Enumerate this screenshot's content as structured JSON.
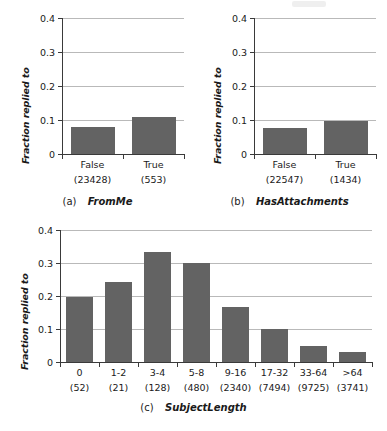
{
  "figure": {
    "background": "#ffffff",
    "bar_color": "#636363",
    "grid_color": "#b9b9b9",
    "axis_color": "#3a3a3a"
  },
  "chart_data": [
    {
      "type": "bar",
      "panel": "a",
      "caption_tag": "(a)",
      "title": "FromMe",
      "xlabel": "",
      "ylabel": "Fraction replied to",
      "categories": [
        "False",
        "True"
      ],
      "counts": [
        "(23428)",
        "(553)"
      ],
      "values": [
        0.078,
        0.108
      ],
      "ylim": [
        0,
        0.4
      ],
      "yticks": [
        0,
        0.1,
        0.2,
        0.3,
        0.4
      ],
      "ytick_labels": [
        "0",
        "0.1",
        "0.2",
        "0.3",
        "0.4"
      ],
      "grid": true,
      "legend": "none"
    },
    {
      "type": "bar",
      "panel": "b",
      "caption_tag": "(b)",
      "title": "HasAttachments",
      "xlabel": "",
      "ylabel": "Fraction replied to",
      "categories": [
        "False",
        "True"
      ],
      "counts": [
        "(22547)",
        "(1434)"
      ],
      "values": [
        0.077,
        0.096
      ],
      "ylim": [
        0,
        0.4
      ],
      "yticks": [
        0,
        0.1,
        0.2,
        0.3,
        0.4
      ],
      "ytick_labels": [
        "0",
        "0.1",
        "0.2",
        "0.3",
        "0.4"
      ],
      "grid": true,
      "legend": "none"
    },
    {
      "type": "bar",
      "panel": "c",
      "caption_tag": "(c)",
      "title": "SubjectLength",
      "xlabel": "",
      "ylabel": "Fraction replied to",
      "categories": [
        "0",
        "1-2",
        "3-4",
        "5-8",
        "9-16",
        "17-32",
        "33-64",
        ">64"
      ],
      "counts": [
        "(52)",
        "(21)",
        "(128)",
        "(480)",
        "(2340)",
        "(7494)",
        "(9725)",
        "(3741)"
      ],
      "values": [
        0.198,
        0.241,
        0.332,
        0.3,
        0.168,
        0.099,
        0.047,
        0.031
      ],
      "ylim": [
        0,
        0.4
      ],
      "yticks": [
        0,
        0.1,
        0.2,
        0.3,
        0.4
      ],
      "ytick_labels": [
        "0",
        "0.1",
        "0.2",
        "0.3",
        "0.4"
      ],
      "grid": true,
      "legend": "none"
    }
  ]
}
